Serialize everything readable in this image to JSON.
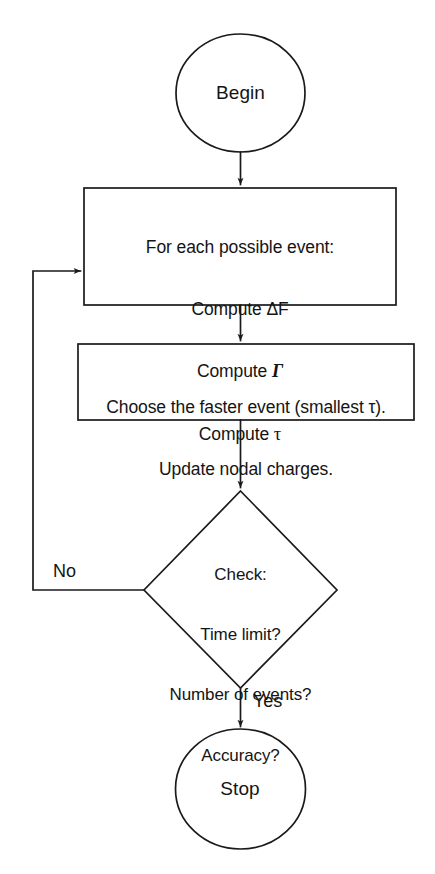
{
  "diagram": {
    "type": "flowchart",
    "background_color": "#ffffff",
    "stroke_color": "#1a1a1a",
    "nodes": [
      {
        "id": "begin",
        "shape": "ellipse",
        "label": "Begin",
        "role": "terminal-start"
      },
      {
        "id": "compute",
        "shape": "rectangle",
        "role": "process",
        "lines": [
          "For each possible event:",
          "Compute ΔF",
          "Compute",
          "Compute"
        ],
        "line1": "For each possible event:",
        "line2": "Compute ΔF",
        "line3_prefix": "Compute ",
        "line3_symbol": "Γ",
        "line4_prefix": "Compute ",
        "line4_symbol": "τ"
      },
      {
        "id": "choose",
        "shape": "rectangle",
        "role": "process",
        "line1": "Choose the faster event (smallest τ).",
        "line2": "Update nodal charges."
      },
      {
        "id": "check",
        "shape": "diamond",
        "role": "decision",
        "line1": "Check:",
        "line2": "Time limit?",
        "line3": "Number of events?",
        "line4": "Accuracy?"
      },
      {
        "id": "stop",
        "shape": "ellipse",
        "label": "Stop",
        "role": "terminal-end"
      }
    ],
    "edges": [
      {
        "id": "begin-to-compute",
        "from": "begin",
        "to": "compute",
        "label": ""
      },
      {
        "id": "compute-to-choose",
        "from": "compute",
        "to": "choose",
        "label": ""
      },
      {
        "id": "choose-to-check",
        "from": "choose",
        "to": "check",
        "label": ""
      },
      {
        "id": "check-to-compute",
        "from": "check",
        "to": "compute",
        "label": "No"
      },
      {
        "id": "check-to-stop",
        "from": "check",
        "to": "stop",
        "label": "Yes"
      }
    ],
    "edge_labels": {
      "no": "No",
      "yes": "Yes"
    }
  }
}
